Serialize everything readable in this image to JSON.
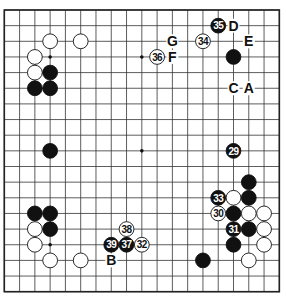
{
  "board": {
    "size": 19,
    "origin_x": 4.3,
    "origin_y": 10,
    "spacing_x": 15.28,
    "spacing_y": 15.65,
    "line_color": "#333333",
    "border_color": "#222222",
    "background": "#ffffff",
    "stone_black": "#111111",
    "stone_white": "#ffffff",
    "star_points": [
      [
        3,
        3
      ],
      [
        9,
        3
      ],
      [
        15,
        3
      ],
      [
        3,
        9
      ],
      [
        9,
        9
      ],
      [
        15,
        9
      ],
      [
        3,
        15
      ],
      [
        9,
        15
      ],
      [
        15,
        15
      ]
    ]
  },
  "stones": [
    {
      "color": "white",
      "col": 3,
      "row": 2
    },
    {
      "color": "white",
      "col": 5,
      "row": 2
    },
    {
      "color": "white",
      "col": 2,
      "row": 3
    },
    {
      "color": "white",
      "col": 2,
      "row": 4
    },
    {
      "color": "black",
      "col": 3,
      "row": 4
    },
    {
      "color": "black",
      "col": 2,
      "row": 5
    },
    {
      "color": "black",
      "col": 3,
      "row": 5
    },
    {
      "color": "black",
      "col": 3,
      "row": 9
    },
    {
      "color": "black",
      "col": 2,
      "row": 13
    },
    {
      "color": "black",
      "col": 3,
      "row": 13
    },
    {
      "color": "white",
      "col": 2,
      "row": 14
    },
    {
      "color": "black",
      "col": 3,
      "row": 14
    },
    {
      "color": "white",
      "col": 2,
      "row": 15
    },
    {
      "color": "white",
      "col": 3,
      "row": 16
    },
    {
      "color": "white",
      "col": 5,
      "row": 16
    },
    {
      "color": "black",
      "col": 15,
      "row": 3
    },
    {
      "color": "black",
      "col": 16,
      "row": 11
    },
    {
      "color": "white",
      "col": 15,
      "row": 12
    },
    {
      "color": "black",
      "col": 16,
      "row": 12
    },
    {
      "color": "black",
      "col": 15,
      "row": 13
    },
    {
      "color": "white",
      "col": 16,
      "row": 13
    },
    {
      "color": "white",
      "col": 17,
      "row": 13
    },
    {
      "color": "black",
      "col": 16,
      "row": 14
    },
    {
      "color": "white",
      "col": 17,
      "row": 14
    },
    {
      "color": "black",
      "col": 15,
      "row": 15
    },
    {
      "color": "white",
      "col": 17,
      "row": 15
    },
    {
      "color": "white",
      "col": 16,
      "row": 16
    },
    {
      "color": "black",
      "col": 13,
      "row": 16
    }
  ],
  "numbered_stones": [
    {
      "color": "black",
      "col": 15,
      "row": 9,
      "number": "29"
    },
    {
      "color": "white",
      "col": 14,
      "row": 13,
      "number": "30"
    },
    {
      "color": "black",
      "col": 15,
      "row": 14,
      "number": "31"
    },
    {
      "color": "white",
      "col": 9,
      "row": 15,
      "number": "32"
    },
    {
      "color": "black",
      "col": 14,
      "row": 12,
      "number": "33"
    },
    {
      "color": "white",
      "col": 13,
      "row": 2,
      "number": "34"
    },
    {
      "color": "black",
      "col": 14,
      "row": 1,
      "number": "35"
    },
    {
      "color": "white",
      "col": 10,
      "row": 3,
      "number": "36"
    },
    {
      "color": "black",
      "col": 8,
      "row": 15,
      "number": "37"
    },
    {
      "color": "white",
      "col": 8,
      "row": 14,
      "number": "38"
    },
    {
      "color": "black",
      "col": 7,
      "row": 15,
      "number": "39"
    }
  ],
  "letter_marks": [
    {
      "label": "A",
      "col": 16,
      "row": 5
    },
    {
      "label": "B",
      "col": 7,
      "row": 16
    },
    {
      "label": "C",
      "col": 15,
      "row": 5
    },
    {
      "label": "D",
      "col": 15,
      "row": 1
    },
    {
      "label": "E",
      "col": 16,
      "row": 2
    },
    {
      "label": "F",
      "col": 11,
      "row": 3
    },
    {
      "label": "G",
      "col": 11,
      "row": 2
    }
  ]
}
